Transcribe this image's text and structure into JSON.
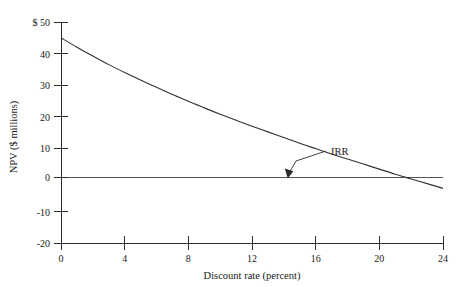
{
  "chart_data": {
    "type": "line",
    "title": "",
    "subtitle": "",
    "xlabel": "Discount rate (percent)",
    "ylabel": "NPV ($ millions)",
    "xlim": [
      0,
      24
    ],
    "ylim": [
      -20,
      50
    ],
    "grid": false,
    "legend": "none",
    "x_ticks": [
      "0",
      "4",
      "8",
      "12",
      "16",
      "20",
      "24"
    ],
    "x_tick_values": [
      0,
      4,
      8,
      12,
      16,
      20,
      24
    ],
    "y_ticks": [
      "$ 50",
      "40",
      "30",
      "20",
      "10",
      "0",
      "-10",
      "-20"
    ],
    "y_tick_values": [
      50,
      40,
      30,
      20,
      10,
      0,
      -10,
      -20
    ],
    "series": [
      {
        "name": "NPV profile",
        "x": [
          0,
          1,
          2,
          3,
          4,
          5,
          6,
          7,
          8,
          9,
          10,
          11,
          12,
          13,
          14,
          15,
          16,
          17,
          18,
          19,
          20,
          21,
          22,
          23,
          24
        ],
        "values": [
          45.0,
          42.0,
          39.2,
          36.5,
          34.0,
          31.6,
          29.3,
          27.0,
          24.9,
          22.8,
          20.8,
          18.9,
          17.0,
          15.2,
          13.4,
          11.6,
          9.9,
          8.2,
          6.6,
          5.0,
          3.4,
          1.8,
          0.3,
          -1.2,
          -2.7
        ]
      }
    ],
    "reference_lines": [
      {
        "name": "zero-npv-line",
        "axis": "y",
        "value": 0
      }
    ],
    "annotations": [
      {
        "name": "irr-annotation",
        "label": "IRR",
        "x": 13.4,
        "y": 0
      }
    ]
  },
  "axis": {
    "y_label": "NPV ($ millions)",
    "x_label": "Discount rate (percent)",
    "y_tick_labels": [
      "$ 50",
      "40",
      "30",
      "20",
      "10",
      "0",
      "-10",
      "-20"
    ],
    "x_tick_labels": [
      "0",
      "4",
      "8",
      "12",
      "16",
      "20",
      "24"
    ]
  },
  "annotation": {
    "irr_label": "IRR"
  },
  "colors": {
    "curve": "#333333",
    "axis": "#2b2b2b",
    "zero_line": "#555555",
    "background": "#ffffff",
    "text": "#1a1a1a"
  }
}
